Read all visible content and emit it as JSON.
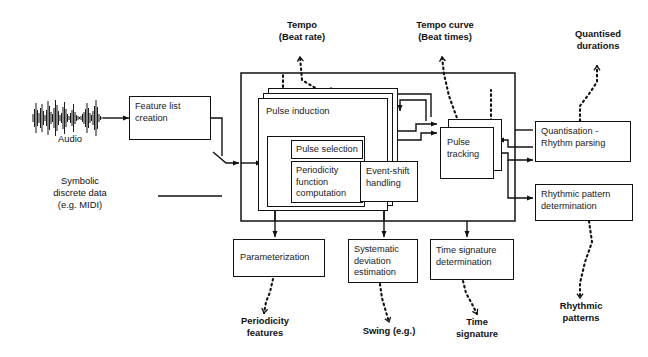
{
  "diagram": {
    "inputs": {
      "audio_label": "Audio",
      "symbolic_label": "Symbolic\ndiscrete data\n(e.g. MIDI)",
      "waveform_icon": "audio-waveform-icon"
    },
    "boxes": {
      "feature_list_creation": "Feature list\ncreation",
      "pulse_induction": "Pulse induction",
      "pulse_selection": "Pulse selection",
      "periodicity_function_computation": "Periodicity\nfunction\ncomputation",
      "event_shift_handling": "Event-shift\nhandling",
      "pulse_tracking": "Pulse\ntracking",
      "quantisation_rhythm_parsing": "Quantisation -\nRhythm parsing",
      "rhythmic_pattern_determination": "Rhythmic pattern\ndetermination",
      "parameterization": "Parameterization",
      "systematic_deviation_estimation": "Systematic\ndeviation\nestimation",
      "time_signature_determination": "Time signature\ndetermination"
    },
    "outputs": {
      "tempo": "Tempo\n(Beat rate)",
      "tempo_curve": "Tempo curve\n(Beat times)",
      "quantised_durations": "Quantised\ndurations",
      "rhythmic_patterns": "Rhythmic\npatterns",
      "periodicity_features": "Periodicity\nfeatures",
      "swing": "Swing (e.g.)",
      "time_signature": "Time\nsignature"
    },
    "colors": {
      "stroke": "#111111",
      "background": "#ffffff",
      "text": "#1a1a1a"
    }
  }
}
